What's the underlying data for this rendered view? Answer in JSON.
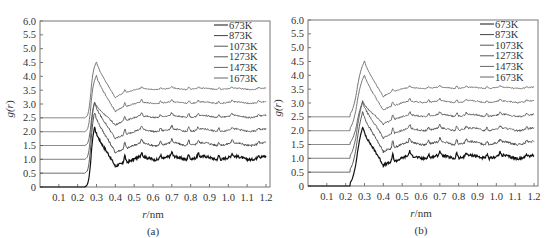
{
  "chart_data": [
    {
      "type": "line",
      "panel_label": "(a)",
      "title": "",
      "xlabel": "r/nm",
      "ylabel": "g(r)",
      "xlim": [
        0,
        1.2
      ],
      "ylim": [
        0,
        6.0
      ],
      "xticks": [
        "0.1",
        "0.2",
        "0.3",
        "0.4",
        "0.5",
        "0.6",
        "0.7",
        "0.8",
        "0.9",
        "1.0",
        "1.1",
        "1.2"
      ],
      "yticks": [
        "0",
        "0.5",
        "1.0",
        "1.5",
        "2.0",
        "2.5",
        "3.0",
        "3.5",
        "4.0",
        "4.5",
        "5.0",
        "5.5",
        "6.0"
      ],
      "grid": false,
      "legend_position": "upper right",
      "note": "Curves vertically offset by 0.5 each; first peak near r=0.29 nm, second near 0.45 nm",
      "series": [
        {
          "name": "673K",
          "offset": 0.0,
          "first_peak": {
            "r": 0.29,
            "g": 2.2
          },
          "baseline_end": 1.05,
          "color": "#111111"
        },
        {
          "name": "873K",
          "offset": 0.5,
          "first_peak": {
            "r": 0.29,
            "g": 2.75
          },
          "baseline_end": 1.55,
          "color": "#444444"
        },
        {
          "name": "1073K",
          "offset": 1.0,
          "first_peak": {
            "r": 0.29,
            "g": 3.1
          },
          "baseline_end": 2.05,
          "color": "#555555"
        },
        {
          "name": "1273K",
          "offset": 1.5,
          "first_peak": {
            "r": 0.29,
            "g": 3.1
          },
          "baseline_end": 2.55,
          "color": "#555555"
        },
        {
          "name": "1473K",
          "offset": 2.0,
          "first_peak": {
            "r": 0.3,
            "g": 4.05
          },
          "baseline_end": 3.05,
          "color": "#666666"
        },
        {
          "name": "1673K",
          "offset": 2.5,
          "first_peak": {
            "r": 0.3,
            "g": 4.55
          },
          "baseline_end": 3.55,
          "color": "#666666"
        }
      ]
    },
    {
      "type": "line",
      "panel_label": "(b)",
      "title": "",
      "xlabel": "r/nm",
      "ylabel": "g(r)",
      "xlim": [
        0,
        1.2
      ],
      "ylim": [
        0,
        6.0
      ],
      "xticks": [
        "0.1",
        "0.2",
        "0.3",
        "0.4",
        "0.5",
        "0.6",
        "0.7",
        "0.8",
        "0.9",
        "1.0",
        "1.1",
        "1.2"
      ],
      "yticks": [
        "0",
        "0.5",
        "1.0",
        "1.5",
        "2.0",
        "2.5",
        "3.0",
        "3.5",
        "4.0",
        "4.5",
        "5.0",
        "5.5",
        "6.0"
      ],
      "grid": false,
      "legend_position": "upper right",
      "note": "Curves vertically offset by 0.5 each; smoother rise starting near r=0.22 nm",
      "series": [
        {
          "name": "673K",
          "offset": 0.0,
          "first_peak": {
            "r": 0.29,
            "g": 2.2
          },
          "baseline_end": 1.05,
          "color": "#111111"
        },
        {
          "name": "873K",
          "offset": 0.5,
          "first_peak": {
            "r": 0.29,
            "g": 2.75
          },
          "baseline_end": 1.55,
          "color": "#444444"
        },
        {
          "name": "1073K",
          "offset": 1.0,
          "first_peak": {
            "r": 0.29,
            "g": 3.1
          },
          "baseline_end": 2.05,
          "color": "#555555"
        },
        {
          "name": "1273K",
          "offset": 1.5,
          "first_peak": {
            "r": 0.29,
            "g": 3.1
          },
          "baseline_end": 2.55,
          "color": "#555555"
        },
        {
          "name": "1473K",
          "offset": 2.0,
          "first_peak": {
            "r": 0.3,
            "g": 4.05
          },
          "baseline_end": 3.05,
          "color": "#666666"
        },
        {
          "name": "1673K",
          "offset": 2.5,
          "first_peak": {
            "r": 0.3,
            "g": 4.55
          },
          "baseline_end": 3.55,
          "color": "#666666"
        }
      ]
    }
  ]
}
